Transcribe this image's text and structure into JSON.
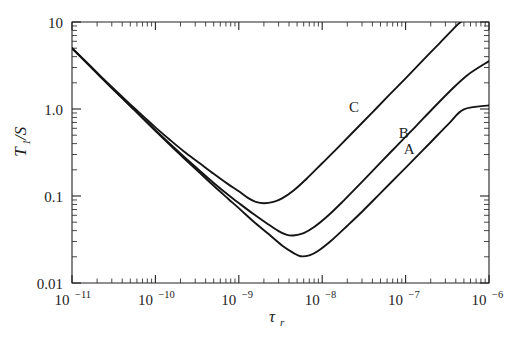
{
  "chart_data": {
    "type": "line",
    "title": "",
    "xlabel": "τ_r",
    "xlabel_base": "τ",
    "xlabel_sub": "r",
    "ylabel": "T₁/S",
    "ylabel_base": "T",
    "ylabel_sub": "1",
    "ylabel_rest": "/S",
    "xscale": "log",
    "yscale": "log",
    "xlim": [
      1e-11,
      1e-06
    ],
    "ylim": [
      0.01,
      10
    ],
    "grid": false,
    "legend": "inline-curve-labels",
    "x_ticks": [
      {
        "value": 1e-11,
        "mantissa": "10",
        "exponent": "−11"
      },
      {
        "value": 1e-10,
        "mantissa": "10",
        "exponent": "−10"
      },
      {
        "value": 1e-09,
        "mantissa": "10",
        "exponent": "−9"
      },
      {
        "value": 1e-08,
        "mantissa": "10",
        "exponent": "−8"
      },
      {
        "value": 1e-07,
        "mantissa": "10",
        "exponent": "−7"
      },
      {
        "value": 1e-06,
        "mantissa": "10",
        "exponent": "−6"
      }
    ],
    "y_ticks": [
      {
        "value": 10,
        "label": "10"
      },
      {
        "value": 1.0,
        "label": "1.0"
      },
      {
        "value": 0.1,
        "label": "0.1"
      },
      {
        "value": 0.01,
        "label": "0.01"
      }
    ],
    "series": [
      {
        "name": "A",
        "label": "A",
        "label_point": {
          "x": 1.1e-07,
          "y": 0.3
        },
        "minimum": {
          "x": 5.5e-09,
          "y": 0.02
        },
        "points": [
          {
            "x": 1e-11,
            "y": 5.0
          },
          {
            "x": 1.5e-11,
            "y": 3.4
          },
          {
            "x": 2.2e-11,
            "y": 2.35
          },
          {
            "x": 3.3e-11,
            "y": 1.6
          },
          {
            "x": 5e-11,
            "y": 1.08
          },
          {
            "x": 7.5e-11,
            "y": 0.735
          },
          {
            "x": 1e-10,
            "y": 0.56
          },
          {
            "x": 1.5e-10,
            "y": 0.385
          },
          {
            "x": 2.2e-10,
            "y": 0.272
          },
          {
            "x": 3.3e-10,
            "y": 0.19
          },
          {
            "x": 5e-10,
            "y": 0.131
          },
          {
            "x": 7.5e-10,
            "y": 0.0925
          },
          {
            "x": 1e-09,
            "y": 0.0725
          },
          {
            "x": 1.5e-09,
            "y": 0.051
          },
          {
            "x": 2.2e-09,
            "y": 0.0375
          },
          {
            "x": 3.3e-09,
            "y": 0.027
          },
          {
            "x": 4.5e-09,
            "y": 0.0222
          },
          {
            "x": 5.5e-09,
            "y": 0.0203
          },
          {
            "x": 7e-09,
            "y": 0.0208
          },
          {
            "x": 9e-09,
            "y": 0.0235
          },
          {
            "x": 1.3e-08,
            "y": 0.031
          },
          {
            "x": 2e-08,
            "y": 0.0455
          },
          {
            "x": 3e-08,
            "y": 0.066
          },
          {
            "x": 5e-08,
            "y": 0.108
          },
          {
            "x": 8e-08,
            "y": 0.17
          },
          {
            "x": 1.3e-07,
            "y": 0.272
          },
          {
            "x": 2e-07,
            "y": 0.415
          },
          {
            "x": 3.3e-07,
            "y": 0.68
          },
          {
            "x": 5e-07,
            "y": 0.99
          },
          {
            "x": 1e-06,
            "y": 1.1
          }
        ]
      },
      {
        "name": "B",
        "label": "B",
        "label_point": {
          "x": 9.5e-08,
          "y": 0.47
        },
        "minimum": {
          "x": 3.7e-09,
          "y": 0.03
        },
        "points": [
          {
            "x": 1e-11,
            "y": 5.0
          },
          {
            "x": 1.5e-11,
            "y": 3.4
          },
          {
            "x": 2.2e-11,
            "y": 2.35
          },
          {
            "x": 3.3e-11,
            "y": 1.6
          },
          {
            "x": 5e-11,
            "y": 1.09
          },
          {
            "x": 7.5e-11,
            "y": 0.745
          },
          {
            "x": 1e-10,
            "y": 0.57
          },
          {
            "x": 1.5e-10,
            "y": 0.396
          },
          {
            "x": 2.2e-10,
            "y": 0.283
          },
          {
            "x": 3.3e-10,
            "y": 0.2
          },
          {
            "x": 5e-10,
            "y": 0.141
          },
          {
            "x": 7.5e-10,
            "y": 0.1025
          },
          {
            "x": 1e-09,
            "y": 0.083
          },
          {
            "x": 1.5e-09,
            "y": 0.062
          },
          {
            "x": 2.2e-09,
            "y": 0.048
          },
          {
            "x": 3e-09,
            "y": 0.0395
          },
          {
            "x": 3.7e-09,
            "y": 0.036
          },
          {
            "x": 4.5e-09,
            "y": 0.0352
          },
          {
            "x": 6e-09,
            "y": 0.0375
          },
          {
            "x": 8e-09,
            "y": 0.044
          },
          {
            "x": 1.2e-08,
            "y": 0.0605
          },
          {
            "x": 1.8e-08,
            "y": 0.088
          },
          {
            "x": 3e-08,
            "y": 0.145
          },
          {
            "x": 5e-08,
            "y": 0.242
          },
          {
            "x": 8e-08,
            "y": 0.385
          },
          {
            "x": 1.3e-07,
            "y": 0.62
          },
          {
            "x": 2e-07,
            "y": 0.955
          },
          {
            "x": 3.3e-07,
            "y": 1.56
          },
          {
            "x": 5.5e-07,
            "y": 2.45
          },
          {
            "x": 1e-06,
            "y": 3.55
          }
        ]
      },
      {
        "name": "C",
        "label": "C",
        "label_point": {
          "x": 2.4e-08,
          "y": 0.93
        },
        "minimum": {
          "x": 1.5e-09,
          "y": 0.082
        },
        "points": [
          {
            "x": 1e-11,
            "y": 5.0
          },
          {
            "x": 1.5e-11,
            "y": 3.42
          },
          {
            "x": 2.2e-11,
            "y": 2.38
          },
          {
            "x": 3.3e-11,
            "y": 1.64
          },
          {
            "x": 5e-11,
            "y": 1.13
          },
          {
            "x": 7.5e-11,
            "y": 0.79
          },
          {
            "x": 1e-10,
            "y": 0.615
          },
          {
            "x": 1.5e-10,
            "y": 0.44
          },
          {
            "x": 2.2e-10,
            "y": 0.325
          },
          {
            "x": 3.3e-10,
            "y": 0.243
          },
          {
            "x": 5e-10,
            "y": 0.18
          },
          {
            "x": 7.5e-10,
            "y": 0.136
          },
          {
            "x": 1e-09,
            "y": 0.1135
          },
          {
            "x": 1.3e-09,
            "y": 0.0945
          },
          {
            "x": 1.6e-09,
            "y": 0.0855
          },
          {
            "x": 2e-09,
            "y": 0.0825
          },
          {
            "x": 2.6e-09,
            "y": 0.0855
          },
          {
            "x": 3.3e-09,
            "y": 0.094
          },
          {
            "x": 4.5e-09,
            "y": 0.115
          },
          {
            "x": 6.5e-09,
            "y": 0.158
          },
          {
            "x": 1e-08,
            "y": 0.238
          },
          {
            "x": 1.5e-08,
            "y": 0.35
          },
          {
            "x": 2.4e-08,
            "y": 0.555
          },
          {
            "x": 4e-08,
            "y": 0.915
          },
          {
            "x": 6.5e-08,
            "y": 1.48
          },
          {
            "x": 1e-07,
            "y": 2.25
          },
          {
            "x": 1.6e-07,
            "y": 3.6
          },
          {
            "x": 2.6e-07,
            "y": 5.8
          },
          {
            "x": 4e-07,
            "y": 8.9
          },
          {
            "x": 4.6e-07,
            "y": 10.0
          }
        ]
      }
    ]
  }
}
